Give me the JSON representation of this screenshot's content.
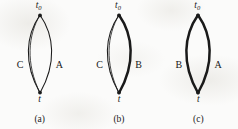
{
  "figure": {
    "background_color": "#fbfbfa",
    "ink_color": "#1a1a1a",
    "panels": [
      {
        "caption": "(a)",
        "top_vertex": {
          "base": "t",
          "subscript": "0"
        },
        "bottom_vertex": {
          "base": "t",
          "subscript": ""
        },
        "left_arc": {
          "label": "C",
          "style": "thin-double"
        },
        "right_arc": {
          "label": "A",
          "style": "thin-single"
        }
      },
      {
        "caption": "(b)",
        "top_vertex": {
          "base": "t",
          "subscript": "0"
        },
        "bottom_vertex": {
          "base": "t",
          "subscript": ""
        },
        "left_arc": {
          "label": "C",
          "style": "thin-double"
        },
        "right_arc": {
          "label": "B",
          "style": "thick"
        }
      },
      {
        "caption": "(c)",
        "top_vertex": {
          "base": "t",
          "subscript": "0"
        },
        "bottom_vertex": {
          "base": "t",
          "subscript": ""
        },
        "left_arc": {
          "label": "B",
          "style": "thick"
        },
        "right_arc": {
          "label": "A",
          "style": "thick"
        }
      }
    ]
  }
}
